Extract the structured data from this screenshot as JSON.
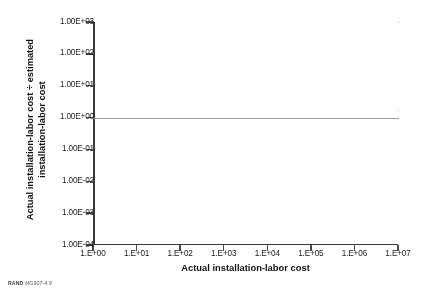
{
  "figure": {
    "source_note_brand": "RAND",
    "source_note_id": "MG907-4.9"
  },
  "chart_data": {
    "type": "scatter",
    "title": "",
    "xlabel": "Actual installation-labor cost",
    "ylabel": "Actual installation-labor cost ÷ estimated installation-labor cost",
    "ylabel_line1": "Actual installation-labor cost ÷ estimated",
    "ylabel_line2": "installation-labor cost",
    "x_scale": "log",
    "y_scale": "log",
    "xlim": [
      1,
      10000000
    ],
    "ylim": [
      0.0001,
      1000
    ],
    "x_tick_labels": [
      "1.E+00",
      "1.E+01",
      "1.E+02",
      "1.E+03",
      "1.E+04",
      "1.E+05",
      "1.E+06",
      "1.E+07"
    ],
    "x_tick_values": [
      1,
      10,
      100,
      1000,
      10000,
      100000,
      1000000,
      10000000
    ],
    "y_tick_labels": [
      "1.00E+03",
      "1.00E+02",
      "1.00E+01",
      "1.00E+00",
      "1.00E-01",
      "1.00E-02",
      "1.00E-03",
      "1.00E-04"
    ],
    "y_tick_values": [
      1000,
      100,
      10,
      1,
      0.1,
      0.01,
      0.001,
      0.0001
    ],
    "grid": "horizontal reference line at y = 1.00E+00",
    "gridline_values": [
      1
    ],
    "legend": null,
    "marker_color": "#000000",
    "marker_size_px": 1.6,
    "point_count_approx": 4200,
    "clusters": [
      {
        "name": "sparse-low-cost",
        "x_range": [
          10,
          1000
        ],
        "y_range": [
          0.0003,
          0.1
        ],
        "n": 60
      },
      {
        "name": "transition",
        "x_range": [
          300,
          5000
        ],
        "y_range": [
          0.01,
          10
        ],
        "n": 600
      },
      {
        "name": "dense-core",
        "x_range": [
          3000,
          3000000
        ],
        "y_range": [
          0.2,
          5
        ],
        "n": 3200
      },
      {
        "name": "upper-tail",
        "x_range": [
          3000,
          300000
        ],
        "y_range": [
          5,
          80
        ],
        "n": 120
      },
      {
        "name": "right-tail",
        "x_range": [
          1000000,
          7000000
        ],
        "y_range": [
          0.4,
          8
        ],
        "n": 220
      }
    ],
    "outliers": [
      {
        "x": 80000,
        "y": 800
      }
    ]
  }
}
